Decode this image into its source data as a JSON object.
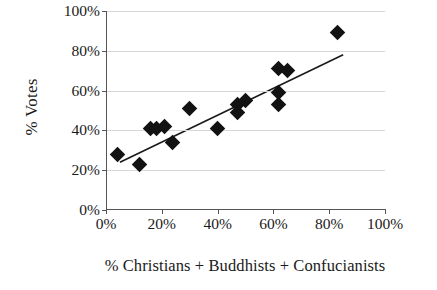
{
  "chart_data": {
    "type": "scatter",
    "title": "",
    "xlabel": "% Christians + Buddhists + Confucianists",
    "ylabel": "% Votes",
    "xlim": [
      0,
      100
    ],
    "ylim": [
      0,
      100
    ],
    "xticks": [
      "0%",
      "20%",
      "40%",
      "60%",
      "80%",
      "100%"
    ],
    "yticks": [
      "0%",
      "20%",
      "40%",
      "60%",
      "80%",
      "100%"
    ],
    "xtick_values": [
      0,
      20,
      40,
      60,
      80,
      100
    ],
    "ytick_values": [
      0,
      20,
      40,
      60,
      80,
      100
    ],
    "grid": "horizontal",
    "legend": "none",
    "marker": "filled-diamond",
    "marker_color": "#121212",
    "series": [
      {
        "name": "Countries",
        "points": [
          {
            "x": 4,
            "y": 28
          },
          {
            "x": 12,
            "y": 23
          },
          {
            "x": 16,
            "y": 41
          },
          {
            "x": 18,
            "y": 41
          },
          {
            "x": 21,
            "y": 42
          },
          {
            "x": 24,
            "y": 34
          },
          {
            "x": 30,
            "y": 51
          },
          {
            "x": 40,
            "y": 41
          },
          {
            "x": 47,
            "y": 49
          },
          {
            "x": 47,
            "y": 53
          },
          {
            "x": 50,
            "y": 55
          },
          {
            "x": 62,
            "y": 71
          },
          {
            "x": 65,
            "y": 70
          },
          {
            "x": 62,
            "y": 59
          },
          {
            "x": 62,
            "y": 53
          },
          {
            "x": 83,
            "y": 89
          }
        ]
      }
    ],
    "trendline": {
      "type": "linear",
      "x_start": 5,
      "y_start": 24,
      "x_end": 85,
      "y_end": 78,
      "color": "#1a1a1a"
    }
  }
}
